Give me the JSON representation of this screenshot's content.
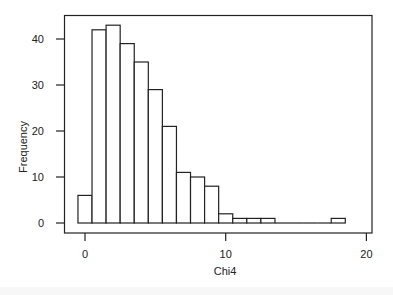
{
  "chart_data": {
    "type": "bar",
    "title": "",
    "xlabel": "Chi4",
    "ylabel": "Frequency",
    "bin_width": 1,
    "bin_start": -0.5,
    "bin_centers": [
      0,
      1,
      2,
      3,
      4,
      5,
      6,
      7,
      8,
      9,
      10,
      11,
      12,
      13,
      14,
      15,
      16,
      17,
      18
    ],
    "values": [
      6,
      42,
      43,
      39,
      35,
      29,
      21,
      11,
      10,
      8,
      2,
      1,
      1,
      1,
      0,
      0,
      0,
      0,
      1
    ],
    "xlim": [
      -1.5,
      20.4
    ],
    "ylim": [
      -2,
      45
    ],
    "x_ticks": [
      0,
      10,
      20
    ],
    "x_tick_labels": [
      "0",
      "10",
      "20"
    ],
    "y_ticks": [
      0,
      10,
      20,
      30,
      40
    ],
    "y_tick_labels": [
      "0",
      "10",
      "20",
      "30",
      "40"
    ],
    "grid": false,
    "legend": null,
    "colors": {
      "bar_fill": "#ffffff",
      "bar_stroke": "#222222",
      "axis": "#222222"
    }
  }
}
